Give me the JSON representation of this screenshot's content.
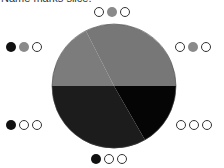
{
  "caption": "Name marks slice.",
  "wheel": {
    "center": [
      114,
      86
    ],
    "radius": 62,
    "slices": [
      {
        "name": "top-left",
        "color": "#7c7c7c"
      },
      {
        "name": "top-right",
        "color": "#777777"
      },
      {
        "name": "bottom-left",
        "color": "#1c1c1c"
      },
      {
        "name": "bottom-right",
        "color": "#050505"
      }
    ]
  },
  "dot_groups": [
    {
      "position": "top",
      "dots": [
        "empty",
        "gray",
        "empty"
      ]
    },
    {
      "position": "upper-left",
      "dots": [
        "black",
        "gray",
        "empty"
      ]
    },
    {
      "position": "upper-right",
      "dots": [
        "empty",
        "gray",
        "empty"
      ]
    },
    {
      "position": "lower-left",
      "dots": [
        "black",
        "empty",
        "empty"
      ]
    },
    {
      "position": "lower-right",
      "dots": [
        "empty",
        "empty",
        "empty"
      ]
    },
    {
      "position": "bottom",
      "dots": [
        "black",
        "empty",
        "empty"
      ]
    }
  ]
}
